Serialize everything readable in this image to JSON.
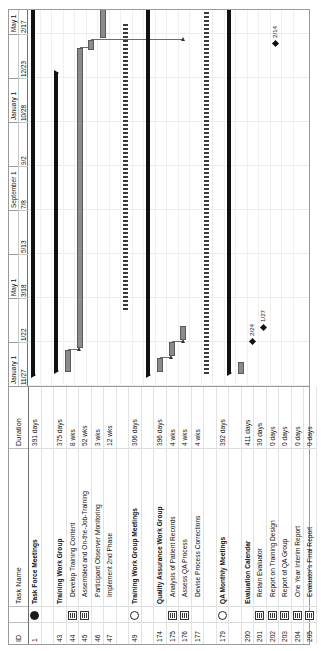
{
  "app": {
    "type": "gantt-chart",
    "orientation": "rotated-90-ccw"
  },
  "table": {
    "headers": {
      "id": "ID",
      "indicator": "",
      "name": "Task Name",
      "duration": "Duration"
    },
    "rows": [
      {
        "id": "1",
        "icon": "dot-filled",
        "name": "Task Force Meetings",
        "duration": "391 days",
        "level": 0,
        "blank": false
      },
      {
        "id": "42",
        "icon": "",
        "name": "",
        "duration": "",
        "level": 0,
        "blank": true
      },
      {
        "id": "43",
        "icon": "",
        "name": "Training Work Group",
        "duration": "375 days",
        "level": 0,
        "blank": false
      },
      {
        "id": "44",
        "icon": "note",
        "name": "Develop Training Content",
        "duration": "8 wks",
        "level": 1,
        "blank": false
      },
      {
        "id": "45",
        "icon": "note",
        "name": "Assembled and On-the-Job-Training",
        "duration": "52 wks",
        "level": 1,
        "blank": false
      },
      {
        "id": "46",
        "icon": "",
        "name": "Participant Observer Monitoring",
        "duration": "3 wks",
        "level": 1,
        "blank": false
      },
      {
        "id": "47",
        "icon": "",
        "name": "Implement 2nd Phase",
        "duration": "12 wks",
        "level": 1,
        "blank": false
      },
      {
        "id": "48",
        "icon": "",
        "name": "",
        "duration": "",
        "level": 0,
        "blank": true
      },
      {
        "id": "49",
        "icon": "dot-open",
        "name": "Training Work Group Meetings",
        "duration": "306 days",
        "level": 0,
        "blank": false
      },
      {
        "id": "173",
        "icon": "",
        "name": "",
        "duration": "",
        "level": 0,
        "blank": true
      },
      {
        "id": "174",
        "icon": "",
        "name": "Quality Assurance Work Group",
        "duration": "396 days",
        "level": 0,
        "blank": false
      },
      {
        "id": "175",
        "icon": "note",
        "name": "Analysis of Patient Records",
        "duration": "4 wks",
        "level": 1,
        "blank": false
      },
      {
        "id": "176",
        "icon": "note",
        "name": "Assess QA Process",
        "duration": "4 wks",
        "level": 1,
        "blank": false
      },
      {
        "id": "177",
        "icon": "",
        "name": "Devise Process Corrections",
        "duration": "4 wks",
        "level": 1,
        "blank": false
      },
      {
        "id": "178",
        "icon": "",
        "name": "",
        "duration": "",
        "level": 0,
        "blank": true
      },
      {
        "id": "179",
        "icon": "dot-open",
        "name": "QA Monthly Meetings",
        "duration": "392 days",
        "level": 0,
        "blank": false
      },
      {
        "id": "199",
        "icon": "",
        "name": "",
        "duration": "",
        "level": 0,
        "blank": true
      },
      {
        "id": "200",
        "icon": "",
        "name": "Evaluation Calendar",
        "duration": "411 days",
        "level": 0,
        "blank": false
      },
      {
        "id": "201",
        "icon": "note",
        "name": "Retain Evaluator",
        "duration": "30 days",
        "level": 1,
        "blank": false
      },
      {
        "id": "202",
        "icon": "note",
        "name": "Report on Training Design",
        "duration": "0 days",
        "level": 1,
        "blank": false
      },
      {
        "id": "203",
        "icon": "note",
        "name": "Report of QA Group",
        "duration": "0 days",
        "level": 1,
        "blank": false
      },
      {
        "id": "204",
        "icon": "note",
        "name": "One Year Interim Report",
        "duration": "0 days",
        "level": 1,
        "blank": false
      },
      {
        "id": "205",
        "icon": "note",
        "name": "Evaluator's Final Report",
        "duration": "0 days",
        "level": 1,
        "blank": false
      }
    ]
  },
  "timeline": {
    "major_ticks": [
      {
        "label": "January 1",
        "left": 0,
        "width": 44
      },
      {
        "label": "",
        "left": 44,
        "width": 44
      },
      {
        "label": "May 1",
        "left": 88,
        "width": 44
      },
      {
        "label": "",
        "left": 132,
        "width": 44
      },
      {
        "label": "September 1",
        "left": 176,
        "width": 44
      },
      {
        "label": "",
        "left": 220,
        "width": 44
      },
      {
        "label": "January 1",
        "left": 264,
        "width": 44
      },
      {
        "label": "",
        "left": 308,
        "width": 44
      },
      {
        "label": "May 1",
        "left": 352,
        "width": 44
      },
      {
        "label": "",
        "left": 396,
        "width": 44
      },
      {
        "label": "Sep",
        "left": 440,
        "width": 40
      }
    ],
    "minor_ticks": [
      {
        "label": "11/27",
        "left": 0,
        "width": 44
      },
      {
        "label": "1/22",
        "left": 44,
        "width": 44
      },
      {
        "label": "3/18",
        "left": 88,
        "width": 44
      },
      {
        "label": "5/13",
        "left": 132,
        "width": 44
      },
      {
        "label": "7/8",
        "left": 176,
        "width": 44
      },
      {
        "label": "9/2",
        "left": 220,
        "width": 44
      },
      {
        "label": "10/28",
        "left": 264,
        "width": 44
      },
      {
        "label": "12/23",
        "left": 308,
        "width": 44
      },
      {
        "label": "2/17",
        "left": 352,
        "width": 44
      },
      {
        "label": "4/14",
        "left": 396,
        "width": 44
      },
      {
        "label": "6/9",
        "left": 440,
        "width": 44
      },
      {
        "label": "8/4",
        "left": 484,
        "width": 40
      }
    ]
  },
  "chart_data": {
    "type": "bar",
    "xlabel": "Timeline",
    "ylabel": "Tasks",
    "bars": [
      {
        "row": 0,
        "kind": "summary",
        "left": 10,
        "width": 376,
        "label": "Task Force Meetings 391 days"
      },
      {
        "row": 2,
        "kind": "summary",
        "left": 14,
        "width": 300,
        "label": "Training Work Group 375 days"
      },
      {
        "row": 3,
        "kind": "task",
        "left": 14,
        "width": 22,
        "label": "Develop Training Content 8 wks"
      },
      {
        "row": 4,
        "kind": "task",
        "left": 38,
        "width": 300,
        "label": "Assembled and On-the-Job-Training 52 wks"
      },
      {
        "row": 5,
        "kind": "task",
        "left": 336,
        "width": 10,
        "label": "Participant Observer Monitoring 3 wks"
      },
      {
        "row": 6,
        "kind": "task",
        "left": 348,
        "width": 42,
        "label": "Implement 2nd Phase 12 wks"
      },
      {
        "row": 8,
        "kind": "dashed",
        "left": 76,
        "width": 288,
        "label": "Training Work Group Meetings 306 days"
      },
      {
        "row": 10,
        "kind": "summary",
        "left": 10,
        "width": 380,
        "label": "Quality Assurance Work Group 396 days"
      },
      {
        "row": 11,
        "kind": "task",
        "left": 14,
        "width": 14,
        "label": "Analysis of Patient Records 4 wks"
      },
      {
        "row": 12,
        "kind": "task",
        "left": 30,
        "width": 14,
        "label": "Assess QA Process 4 wks"
      },
      {
        "row": 13,
        "kind": "task",
        "left": 46,
        "width": 14,
        "label": "Devise Process Corrections 4 wks"
      },
      {
        "row": 15,
        "kind": "dashed",
        "left": 12,
        "width": 380,
        "label": "QA Monthly Meetings 392 days"
      },
      {
        "row": 17,
        "kind": "summary",
        "left": 12,
        "width": 412,
        "label": "Evaluation Calendar 411 days"
      },
      {
        "row": 18,
        "kind": "task",
        "left": 12,
        "width": 12,
        "label": "Retain Evaluator 30 days"
      }
    ],
    "milestones": [
      {
        "row": 19,
        "left": 42,
        "label": "2/24"
      },
      {
        "row": 20,
        "left": 56,
        "label": "1/27"
      },
      {
        "row": 21,
        "left": 340,
        "label": "2/14"
      },
      {
        "row": 22,
        "left": 490,
        "label": "7/30"
      }
    ],
    "links": [
      {
        "from_row": 3,
        "to_row": 4,
        "x": 36
      },
      {
        "from_row": 4,
        "to_row": 5,
        "x": 338
      },
      {
        "from_row": 11,
        "to_row": 12,
        "x": 28
      },
      {
        "from_row": 12,
        "to_row": 13,
        "x": 44
      },
      {
        "from_row": 5,
        "to_row": 13,
        "x": 346
      }
    ]
  }
}
